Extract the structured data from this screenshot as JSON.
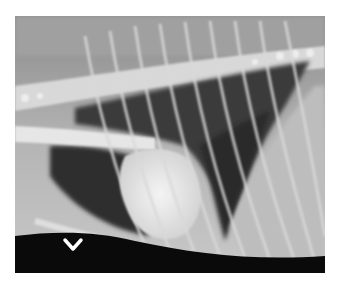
{
  "image": {
    "kind": "lateral thoracic radiograph",
    "background_color": "#ffffff",
    "frame": {
      "x": 15,
      "y": 16,
      "width": 310,
      "height": 257
    }
  },
  "overlay": {
    "marker_icon": "chevron-down-icon",
    "marker_color": "#ffffff"
  }
}
